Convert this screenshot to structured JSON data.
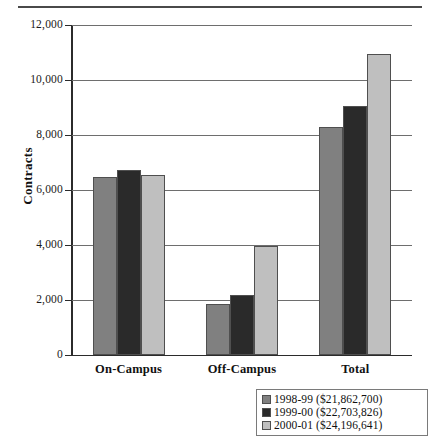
{
  "chart_data": {
    "type": "bar",
    "title": "",
    "xlabel": "",
    "ylabel": "Contracts",
    "ylim": [
      0,
      12000
    ],
    "ytick_values": [
      0,
      2000,
      4000,
      6000,
      8000,
      10000,
      12000
    ],
    "ytick_labels": [
      "0",
      "2,000",
      "4,000",
      "6,000",
      "8,000",
      "10,000",
      "12,000"
    ],
    "grid": true,
    "legend_position": "bottom-right",
    "categories": [
      "On-Campus",
      "Off-Campus",
      "Total"
    ],
    "series": [
      {
        "name": "1998-99 ($21,862,700)",
        "year": "1998-99",
        "amount": "$21,862,700",
        "color": "#808080",
        "values": [
          6470,
          1850,
          8300
        ]
      },
      {
        "name": "1999-00 ($22,703,826)",
        "year": "1999-00",
        "amount": "$22,703,826",
        "color": "#2a2a2a",
        "values": [
          6730,
          2200,
          9050
        ]
      },
      {
        "name": "2000-01 ($24,196,641)",
        "year": "2000-01",
        "amount": "$24,196,641",
        "color": "#bfbfbf",
        "values": [
          6550,
          3960,
          10960
        ]
      }
    ]
  },
  "legend": {
    "items": [
      {
        "label": "1998-99 ($21,862,700)",
        "color": "#808080"
      },
      {
        "label": "1999-00 ($22,703,826)",
        "color": "#2a2a2a"
      },
      {
        "label": "2000-01 ($24,196,641)",
        "color": "#bfbfbf"
      }
    ]
  },
  "axis": {
    "y_title": "Contracts"
  }
}
